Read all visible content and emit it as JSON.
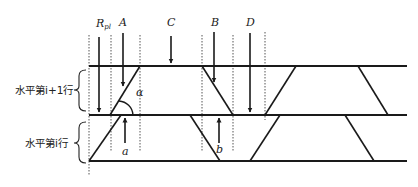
{
  "labels": {
    "r_pl_main": "R",
    "r_pl_sub": "pl",
    "a_upper": "A",
    "c": "C",
    "b_upper": "B",
    "d": "D",
    "alpha": "α",
    "a_lower": "a",
    "b_lower": "b",
    "row_upper": "水平第i+1行",
    "row_lower": "水平第i行"
  }
}
